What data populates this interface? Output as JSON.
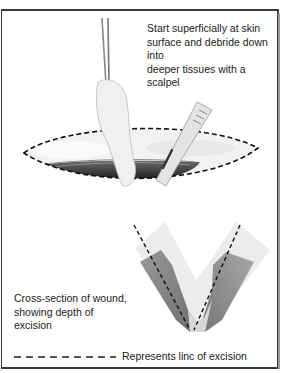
{
  "figure": {
    "top_caption": [
      "Start superficially at skin",
      "surface and debride down into",
      "deeper tissues with a scalpel"
    ],
    "cross_section_caption": [
      "Cross-section of wound,",
      "showing depth of excision"
    ],
    "legend": {
      "symbol": "dashed-line",
      "text": "Represents linc of excision"
    },
    "illustrations": [
      {
        "name": "wound-top-view",
        "description": "Elliptical wound with dashed excision outline, forceps held by hand and scalpel debriding tissue"
      },
      {
        "name": "wound-cross-section",
        "description": "V-shaped cross-section of skin and tissue layers with dashed excision lines"
      }
    ],
    "colors": {
      "frame": "#3a3a3a",
      "dashed_line": "#111111",
      "deep_tissue": "#1a1a1a",
      "muscle": "#8a8a8a",
      "fat": "#e6e6e6"
    }
  }
}
